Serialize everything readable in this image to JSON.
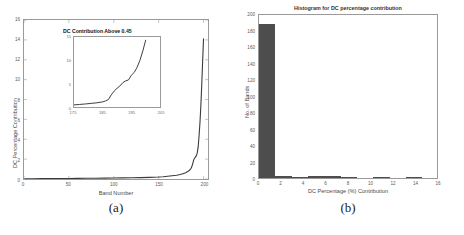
{
  "figure": {
    "caption_a": "(a)",
    "caption_b": "(b)"
  },
  "chart_data": [
    {
      "id": "panel-a",
      "type": "line",
      "title": "",
      "xlabel": "Band Number",
      "ylabel": "DC Percentage Contribution",
      "xlim": [
        0,
        205
      ],
      "ylim": [
        0,
        16
      ],
      "xticks": [
        "0",
        "50",
        "100",
        "150",
        "200"
      ],
      "xtick_values": [
        0,
        50,
        100,
        150,
        200
      ],
      "yticks": [
        "0",
        "2",
        "4",
        "6",
        "8",
        "10",
        "12",
        "14",
        "16"
      ],
      "ytick_values": [
        0,
        2,
        4,
        6,
        8,
        10,
        12,
        14,
        16
      ],
      "grid": false,
      "legend": "none",
      "line_color": "#3a3a3a",
      "x": [
        1,
        10,
        20,
        30,
        40,
        50,
        60,
        70,
        80,
        90,
        100,
        110,
        120,
        130,
        140,
        150,
        155,
        160,
        165,
        170,
        174,
        177,
        180,
        182,
        184,
        186,
        187,
        188,
        189,
        190,
        191,
        192,
        193,
        194,
        195,
        196,
        197,
        198,
        199,
        200
      ],
      "y": [
        0.02,
        0.03,
        0.04,
        0.045,
        0.05,
        0.055,
        0.06,
        0.07,
        0.08,
        0.09,
        0.1,
        0.11,
        0.12,
        0.14,
        0.16,
        0.2,
        0.23,
        0.27,
        0.32,
        0.38,
        0.45,
        0.52,
        0.62,
        0.72,
        0.85,
        1.05,
        1.25,
        1.55,
        1.9,
        2.1,
        2.2,
        2.35,
        2.6,
        3.2,
        4.3,
        5.6,
        7.3,
        9.4,
        11.8,
        14.1
      ]
    },
    {
      "id": "panel-a-inset",
      "type": "line",
      "title": "DC Contribution Above 0.45",
      "xlabel": "",
      "ylabel": "",
      "xlim": [
        175,
        205
      ],
      "ylim": [
        0,
        15
      ],
      "xticks": [
        "175",
        "185",
        "195",
        "205"
      ],
      "xtick_values": [
        175,
        185,
        195,
        205
      ],
      "yticks": [
        "0",
        "5",
        "10",
        "15"
      ],
      "ytick_values": [
        0,
        5,
        10,
        15
      ],
      "grid": false,
      "line_color": "#3a3a3a",
      "x": [
        175,
        177,
        179,
        181,
        183,
        185,
        186,
        187,
        188,
        189,
        190,
        191,
        192,
        193,
        194,
        195,
        196,
        197,
        198,
        199,
        200
      ],
      "y": [
        0.45,
        0.55,
        0.65,
        0.78,
        0.9,
        1.1,
        1.3,
        1.6,
        2.6,
        3.4,
        4.0,
        4.5,
        5.2,
        5.6,
        5.8,
        6.8,
        7.4,
        8.5,
        10.0,
        12.0,
        14.3
      ]
    },
    {
      "id": "panel-b",
      "type": "bar",
      "title": "Histogram for DC percentage contribution",
      "xlabel": "DC Percentage (%) Contribution",
      "ylabel": "No. of Bands",
      "xlim": [
        0,
        16
      ],
      "ylim": [
        0,
        200
      ],
      "xticks": [
        "0",
        "2",
        "4",
        "6",
        "8",
        "10",
        "12",
        "14",
        "16"
      ],
      "xtick_values": [
        0,
        2,
        4,
        6,
        8,
        10,
        12,
        14,
        16
      ],
      "yticks": [
        "0",
        "20",
        "40",
        "60",
        "80",
        "100",
        "120",
        "140",
        "160",
        "180",
        "200"
      ],
      "ytick_values": [
        0,
        20,
        40,
        60,
        80,
        100,
        120,
        140,
        160,
        180,
        200
      ],
      "grid": false,
      "bar_color": "#4d4d4d",
      "bin_edges": [
        0,
        1.45,
        2.9,
        4.35,
        5.8,
        7.25,
        8.7,
        10.15,
        11.6,
        13.05,
        14.5
      ],
      "bin_centers": [
        0.7,
        2.2,
        3.6,
        5.1,
        6.5,
        8.0,
        9.4,
        10.9,
        12.3,
        13.8
      ],
      "values": [
        187,
        3,
        1,
        2,
        3,
        1,
        0,
        1,
        0,
        1
      ]
    }
  ]
}
